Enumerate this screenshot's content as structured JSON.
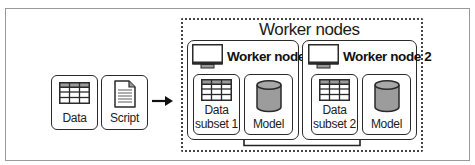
{
  "diagram": {
    "title": "Worker nodes",
    "inputs": [
      {
        "label": "Data",
        "icon": "table-icon"
      },
      {
        "label": "Script",
        "icon": "document-icon"
      }
    ],
    "arrow": "right-arrow",
    "worker_nodes": [
      {
        "title": "Worker node 1",
        "icon": "monitor-icon",
        "items": [
          {
            "label_line1": "Data",
            "label_line2": "subset 1",
            "icon": "table-icon"
          },
          {
            "label": "Model",
            "icon": "database-cylinder-icon"
          }
        ]
      },
      {
        "title": "Worker node 2",
        "icon": "monitor-icon",
        "items": [
          {
            "label_line1": "Data",
            "label_line2": "subset 2",
            "icon": "table-icon"
          },
          {
            "label": "Model",
            "icon": "database-cylinder-icon"
          }
        ]
      }
    ],
    "colors": {
      "stroke": "#2a2a2a",
      "table_header": "#9a9a9a",
      "cylinder_fill": "#9c9c9c",
      "frame": "#9a9a9a"
    }
  }
}
